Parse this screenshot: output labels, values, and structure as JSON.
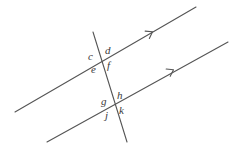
{
  "figure": {
    "type": "geometry-diagram",
    "background_color": "#ffffff",
    "stroke_color": "#555555",
    "label_color": "#3a3a3a",
    "lines": [
      {
        "name": "upper-parallel-line",
        "x1": 15,
        "y1": 112,
        "x2": 196,
        "y2": 7,
        "marker": "single-arrow",
        "marker_position": {
          "x": 152,
          "y": 32
        }
      },
      {
        "name": "lower-parallel-line",
        "x1": 47,
        "y1": 142,
        "x2": 228,
        "y2": 42,
        "marker": "single-arrow",
        "marker_position": {
          "x": 173,
          "y": 70
        }
      },
      {
        "name": "transversal-line",
        "x1": 93,
        "y1": 32,
        "x2": 127,
        "y2": 142,
        "marker": "none"
      }
    ],
    "intersections": [
      {
        "name": "upper-intersection",
        "x": 103,
        "y": 60
      },
      {
        "name": "lower-intersection",
        "x": 116,
        "y": 105
      }
    ],
    "labels": [
      {
        "id": "c",
        "text": "c",
        "x": 88,
        "y": 51,
        "position": "upper-intersection-left-above"
      },
      {
        "id": "d",
        "text": "d",
        "x": 105,
        "y": 45,
        "position": "upper-intersection-right-above"
      },
      {
        "id": "e",
        "text": "e",
        "x": 91,
        "y": 64,
        "position": "upper-intersection-left-below"
      },
      {
        "id": "f",
        "text": "f",
        "x": 107,
        "y": 60,
        "position": "upper-intersection-right-below"
      },
      {
        "id": "g",
        "text": "g",
        "x": 101,
        "y": 96,
        "position": "lower-intersection-left-above"
      },
      {
        "id": "h",
        "text": "h",
        "x": 117,
        "y": 90,
        "position": "lower-intersection-right-above"
      },
      {
        "id": "j",
        "text": "j",
        "x": 105,
        "y": 110,
        "position": "lower-intersection-left-below"
      },
      {
        "id": "k",
        "text": "k",
        "x": 119,
        "y": 105,
        "position": "lower-intersection-right-below"
      }
    ]
  }
}
